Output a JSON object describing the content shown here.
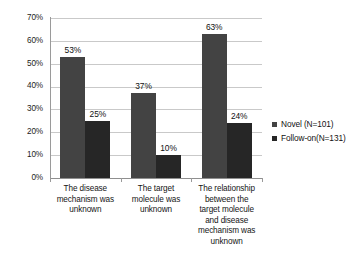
{
  "chart_data": {
    "type": "bar",
    "title": "",
    "subtitle": "",
    "xlabel": "",
    "ylabel": "",
    "ylim": [
      0,
      70
    ],
    "ytick_step": 10,
    "ytick_labels": [
      "0%",
      "10%",
      "20%",
      "30%",
      "40%",
      "50%",
      "60%",
      "70%"
    ],
    "grid": true,
    "legend_position": "right",
    "value_suffix": "%",
    "categories": [
      "The disease mechanism was unknown",
      "The target molecule was unknown",
      "The relationship between the target molecule and disease mechanism was unknown"
    ],
    "category_lines": [
      [
        "The disease",
        "mechanism was",
        "unknown"
      ],
      [
        "The target",
        "molecule was",
        "unknown"
      ],
      [
        "The relationship",
        "between the",
        "target molecule",
        "and disease",
        "mechanism was",
        "unknown"
      ]
    ],
    "series": [
      {
        "name": "Novel    (N=101)",
        "color": "#434343",
        "values": [
          53,
          37,
          63
        ],
        "data_labels": [
          "53%",
          "37%",
          "63%"
        ]
      },
      {
        "name": "Follow-on(N=131)",
        "color": "#262626",
        "values": [
          25,
          10,
          24
        ],
        "data_labels": [
          "25%",
          "10%",
          "24%"
        ]
      }
    ]
  },
  "legend": {
    "items": [
      {
        "label": "Novel    (N=101)",
        "color": "#434343"
      },
      {
        "label": "Follow-on(N=131)",
        "color": "#262626"
      }
    ]
  },
  "colors": {
    "series_novel": "#434343",
    "series_followon": "#262626",
    "gridline": "#c9c9c9",
    "axis": "#8f8f8f",
    "background": "#ffffff",
    "text": "#111111"
  }
}
